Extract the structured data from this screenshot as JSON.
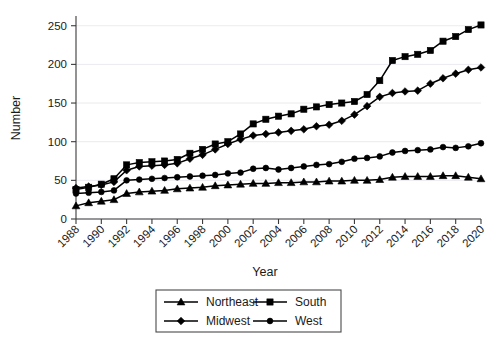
{
  "chart_data": {
    "type": "line",
    "title": "",
    "xlabel": "Year",
    "ylabel": "Number",
    "xlim": [
      1988,
      2020
    ],
    "ylim": [
      0,
      260
    ],
    "yticks": [
      0,
      50,
      100,
      150,
      200,
      250
    ],
    "xticks": [
      1988,
      1990,
      1992,
      1994,
      1996,
      1998,
      2000,
      2002,
      2004,
      2006,
      2008,
      2010,
      2012,
      2014,
      2016,
      2018,
      2020
    ],
    "x": [
      1988,
      1989,
      1990,
      1991,
      1992,
      1993,
      1994,
      1995,
      1996,
      1997,
      1998,
      1999,
      2000,
      2001,
      2002,
      2003,
      2004,
      2005,
      2006,
      2007,
      2008,
      2009,
      2010,
      2011,
      2012,
      2013,
      2014,
      2015,
      2016,
      2017,
      2018,
      2019,
      2020
    ],
    "grid": true,
    "legend_position": "bottom",
    "series": [
      {
        "name": "Northeast",
        "marker": "triangle",
        "values": [
          17,
          21,
          23,
          25,
          33,
          35,
          36,
          37,
          39,
          40,
          41,
          43,
          44,
          45,
          46,
          46,
          47,
          47,
          48,
          48,
          49,
          49,
          50,
          50,
          51,
          54,
          55,
          55,
          55,
          56,
          56,
          54,
          52
        ]
      },
      {
        "name": "Midwest",
        "marker": "diamond",
        "values": [
          40,
          42,
          44,
          48,
          63,
          68,
          69,
          70,
          72,
          78,
          83,
          90,
          97,
          103,
          108,
          110,
          112,
          114,
          116,
          120,
          122,
          127,
          135,
          146,
          158,
          163,
          165,
          166,
          175,
          182,
          188,
          193,
          196
        ]
      },
      {
        "name": "South",
        "marker": "square",
        "values": [
          38,
          41,
          45,
          52,
          70,
          73,
          74,
          75,
          77,
          85,
          90,
          97,
          100,
          110,
          123,
          129,
          133,
          136,
          142,
          145,
          148,
          150,
          152,
          161,
          179,
          205,
          210,
          213,
          218,
          230,
          236,
          245,
          251
        ]
      },
      {
        "name": "West",
        "marker": "circle",
        "values": [
          33,
          34,
          35,
          37,
          50,
          51,
          52,
          53,
          54,
          55,
          56,
          57,
          59,
          60,
          65,
          66,
          64,
          66,
          68,
          70,
          71,
          74,
          78,
          79,
          81,
          86,
          88,
          89,
          90,
          93,
          92,
          94,
          98
        ]
      }
    ]
  },
  "legend": {
    "entries": [
      {
        "label": "Northeast"
      },
      {
        "label": "South"
      },
      {
        "label": "Midwest"
      },
      {
        "label": "West"
      }
    ]
  }
}
